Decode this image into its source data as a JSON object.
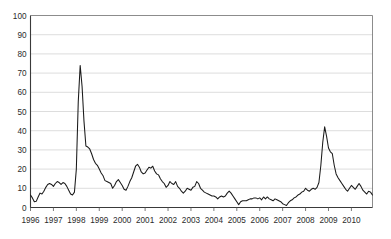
{
  "chart_data": {
    "type": "line",
    "title": "",
    "subtitle": "",
    "xlabel": "",
    "ylabel": "",
    "ylim": [
      0,
      100
    ],
    "yticks": [
      0,
      10,
      20,
      30,
      40,
      50,
      60,
      70,
      80,
      90,
      100
    ],
    "ytick_labels": [
      "0",
      "10",
      "20",
      "30",
      "40",
      "50",
      "60",
      "70",
      "80",
      "90",
      "100"
    ],
    "xlim": [
      1996.0,
      2010.92
    ],
    "xticks": [
      1996,
      1997,
      1998,
      1999,
      2000,
      2001,
      2002,
      2003,
      2004,
      2005,
      2006,
      2007,
      2008,
      2009,
      2010
    ],
    "xtick_labels": [
      "1996",
      "1997",
      "1998",
      "1999",
      "2000",
      "2001",
      "2002",
      "2003",
      "2004",
      "2005",
      "2006",
      "2007",
      "2008",
      "2009",
      "2010"
    ],
    "grid": "horizontal",
    "legend": "none",
    "annotations": [],
    "series": [
      {
        "name": "series-1",
        "color": "#1a1a1a",
        "x": [
          1996.0,
          1996.083,
          1996.167,
          1996.25,
          1996.333,
          1996.417,
          1996.5,
          1996.583,
          1996.667,
          1996.75,
          1996.833,
          1996.917,
          1997.0,
          1997.083,
          1997.167,
          1997.25,
          1997.333,
          1997.417,
          1997.5,
          1997.583,
          1997.667,
          1997.75,
          1997.833,
          1997.917,
          1998.0,
          1998.083,
          1998.167,
          1998.25,
          1998.333,
          1998.417,
          1998.5,
          1998.583,
          1998.667,
          1998.75,
          1998.833,
          1998.917,
          1999.0,
          1999.083,
          1999.167,
          1999.25,
          1999.333,
          1999.417,
          1999.5,
          1999.583,
          1999.667,
          1999.75,
          1999.833,
          1999.917,
          2000.0,
          2000.083,
          2000.167,
          2000.25,
          2000.333,
          2000.417,
          2000.5,
          2000.583,
          2000.667,
          2000.75,
          2000.833,
          2000.917,
          2001.0,
          2001.083,
          2001.167,
          2001.25,
          2001.333,
          2001.417,
          2001.5,
          2001.583,
          2001.667,
          2001.75,
          2001.833,
          2001.917,
          2002.0,
          2002.083,
          2002.167,
          2002.25,
          2002.333,
          2002.417,
          2002.5,
          2002.583,
          2002.667,
          2002.75,
          2002.833,
          2002.917,
          2003.0,
          2003.083,
          2003.167,
          2003.25,
          2003.333,
          2003.417,
          2003.5,
          2003.583,
          2003.667,
          2003.75,
          2003.833,
          2003.917,
          2004.0,
          2004.083,
          2004.167,
          2004.25,
          2004.333,
          2004.417,
          2004.5,
          2004.583,
          2004.667,
          2004.75,
          2004.833,
          2004.917,
          2005.0,
          2005.083,
          2005.167,
          2005.25,
          2005.333,
          2005.417,
          2005.5,
          2005.583,
          2005.667,
          2005.75,
          2005.833,
          2005.917,
          2006.0,
          2006.083,
          2006.167,
          2006.25,
          2006.333,
          2006.417,
          2006.5,
          2006.583,
          2006.667,
          2006.75,
          2006.833,
          2006.917,
          2007.0,
          2007.083,
          2007.167,
          2007.25,
          2007.333,
          2007.417,
          2007.5,
          2007.583,
          2007.667,
          2007.75,
          2007.833,
          2007.917,
          2008.0,
          2008.083,
          2008.167,
          2008.25,
          2008.333,
          2008.417,
          2008.5,
          2008.583,
          2008.667,
          2008.75,
          2008.833,
          2008.917,
          2009.0,
          2009.083,
          2009.167,
          2009.25,
          2009.333,
          2009.417,
          2009.5,
          2009.583,
          2009.667,
          2009.75,
          2009.833,
          2009.917,
          2010.0,
          2010.083,
          2010.167,
          2010.25,
          2010.333,
          2010.417,
          2010.5,
          2010.583,
          2010.667,
          2010.75,
          2010.833,
          2010.917
        ],
        "values": [
          6.5,
          5.0,
          3.0,
          3.2,
          5.5,
          7.5,
          7.0,
          8.5,
          10.5,
          12.0,
          12.5,
          12.0,
          11.0,
          12.5,
          13.5,
          13.0,
          12.0,
          13.0,
          12.5,
          11.0,
          9.0,
          7.0,
          6.5,
          8.0,
          20.0,
          55.0,
          74.0,
          63.0,
          45.0,
          32.0,
          31.5,
          30.5,
          28.0,
          25.0,
          23.0,
          22.0,
          20.0,
          18.0,
          16.5,
          14.0,
          13.5,
          13.0,
          12.5,
          10.0,
          11.5,
          13.5,
          14.5,
          13.0,
          11.5,
          9.5,
          9.0,
          11.0,
          13.5,
          15.5,
          18.5,
          21.5,
          22.5,
          21.0,
          18.5,
          17.5,
          18.0,
          19.5,
          21.0,
          20.5,
          21.5,
          19.0,
          17.5,
          17.0,
          15.0,
          13.5,
          12.5,
          10.5,
          11.5,
          13.5,
          12.5,
          12.0,
          13.5,
          11.0,
          10.0,
          8.5,
          7.5,
          8.5,
          10.0,
          9.5,
          9.0,
          10.5,
          11.0,
          13.5,
          12.5,
          10.0,
          9.0,
          8.0,
          7.5,
          7.0,
          6.5,
          6.0,
          6.0,
          5.5,
          4.5,
          5.5,
          6.0,
          5.5,
          6.0,
          7.5,
          8.5,
          7.5,
          6.0,
          4.5,
          3.0,
          1.5,
          3.0,
          3.5,
          3.5,
          3.5,
          4.0,
          4.5,
          4.5,
          5.0,
          5.0,
          4.5,
          5.0,
          4.0,
          5.5,
          4.5,
          5.5,
          4.5,
          4.0,
          3.5,
          4.5,
          4.0,
          3.5,
          3.0,
          2.0,
          1.5,
          1.0,
          2.5,
          3.5,
          4.0,
          5.0,
          5.5,
          6.5,
          7.0,
          8.0,
          8.5,
          10.0,
          9.0,
          8.5,
          9.5,
          10.0,
          9.5,
          10.5,
          13.0,
          22.0,
          34.0,
          42.0,
          37.0,
          31.0,
          29.0,
          28.0,
          22.0,
          17.5,
          15.5,
          14.0,
          12.5,
          11.0,
          9.5,
          8.5,
          10.0,
          11.5,
          10.5,
          9.5,
          11.0,
          12.5,
          11.0,
          9.0,
          8.0,
          7.0,
          8.5,
          8.0,
          6.5
        ]
      }
    ]
  }
}
